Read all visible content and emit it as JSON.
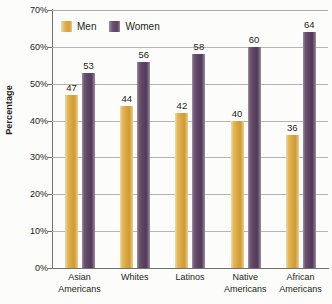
{
  "chart_data": {
    "type": "bar",
    "title": "",
    "subtitle": "",
    "xlabel": "",
    "ylabel": "Percentage",
    "ylim": [
      0,
      70
    ],
    "ytick_labels": [
      "0%",
      "10%",
      "20%",
      "30%",
      "40%",
      "50%",
      "60%",
      "70%"
    ],
    "ytick_values": [
      0,
      10,
      20,
      30,
      40,
      50,
      60,
      70
    ],
    "grid": true,
    "grid_orientation": "horizontal",
    "legend_position": "top-left-inside",
    "categories": [
      "Asian Americans",
      "Whites",
      "Latinos",
      "Native Americans",
      "African Americans"
    ],
    "category_lines": [
      [
        "Asian",
        "Americans"
      ],
      [
        "Whites",
        ""
      ],
      [
        "Latinos",
        ""
      ],
      [
        "Native",
        "Americans"
      ],
      [
        "African",
        "Americans"
      ]
    ],
    "series": [
      {
        "name": "Men",
        "color": "#d9a843",
        "values": [
          47,
          44,
          42,
          40,
          36
        ],
        "labels": [
          "47",
          "44",
          "42",
          "40",
          "36"
        ]
      },
      {
        "name": "Women",
        "color": "#5c4462",
        "values": [
          53,
          56,
          58,
          60,
          64
        ],
        "labels": [
          "53",
          "56",
          "58",
          "60",
          "64"
        ]
      }
    ]
  },
  "legend": {
    "items": [
      {
        "label": "Men",
        "color": "#d9a843"
      },
      {
        "label": "Women",
        "color": "#5c4462"
      }
    ]
  },
  "axes": {
    "y_title": "Percentage"
  }
}
